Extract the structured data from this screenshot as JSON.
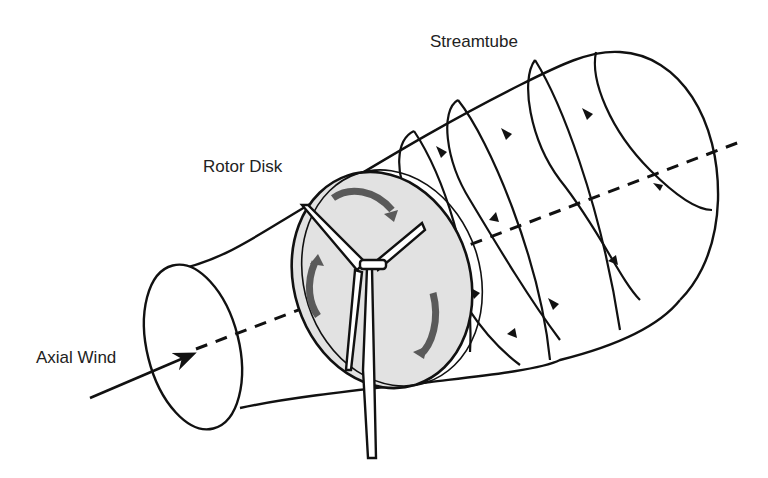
{
  "diagram": {
    "labels": {
      "streamtube": "Streamtube",
      "rotor_disk": "Rotor Disk",
      "axial_wind": "Axial Wind"
    },
    "colors": {
      "stroke": "#111111",
      "disk_fill": "#e2e2e2",
      "rotation_arrows": "#5a5a5a",
      "background": "#ffffff"
    }
  }
}
